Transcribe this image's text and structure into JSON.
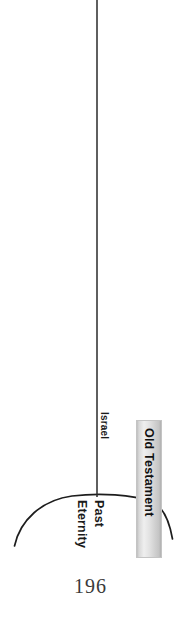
{
  "page": {
    "number": "196",
    "background_color": "#ffffff",
    "width": 181,
    "height": 625
  },
  "diagram": {
    "orientation": "rotated-90-clockwise",
    "ink_color": "#1a1a1a",
    "labels": {
      "israel": "Israel",
      "eternity": "Eternity",
      "past": "Past",
      "old_testament": "Old Testament"
    },
    "era_bar": {
      "label": "Old Testament",
      "fill_light": "#f2f2f2",
      "fill_mid": "#dcdcdc",
      "fill_edge": "#b4b4b4",
      "border_color": "#c9c9c9"
    },
    "timeline_arc": {
      "stroke_color": "#1d1d1d",
      "stroke_width": 1.6
    },
    "event_marker": {
      "label": "Israel",
      "stroke_color": "#2a2a2a",
      "stroke_width": 1.5
    }
  }
}
